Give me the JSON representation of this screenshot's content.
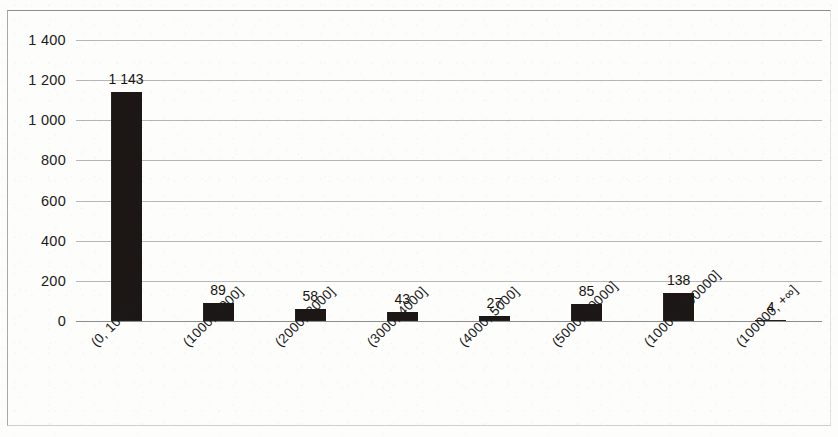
{
  "chart_data": {
    "type": "bar",
    "title": "",
    "subtitle": "",
    "xlabel": "",
    "ylabel": "",
    "ylim": [
      0,
      1400
    ],
    "yticks": [
      0,
      200,
      400,
      600,
      800,
      1000,
      1200,
      1400
    ],
    "ytick_labels": [
      "0",
      "200",
      "400",
      "600",
      "800",
      "1 000",
      "1 200",
      "1 400"
    ],
    "grid": "horizontal",
    "legend": "none",
    "bar_color": "#1c1715",
    "gridline_color": "#b6b6b6",
    "axis_color": "#8c8c8c",
    "categories": [
      "(0, 1000]",
      "(1000, 2000]",
      "(2000, 3000]",
      "(3000, 4000]",
      "(4000, 5000]",
      "(5000, 10000]",
      "(10000, 100000]",
      "(100000, +∞]"
    ],
    "values": [
      1143,
      89,
      58,
      43,
      27,
      85,
      138,
      4
    ],
    "value_labels": [
      "1 143",
      "89",
      "58",
      "43",
      "27",
      "85",
      "138",
      "4"
    ]
  }
}
